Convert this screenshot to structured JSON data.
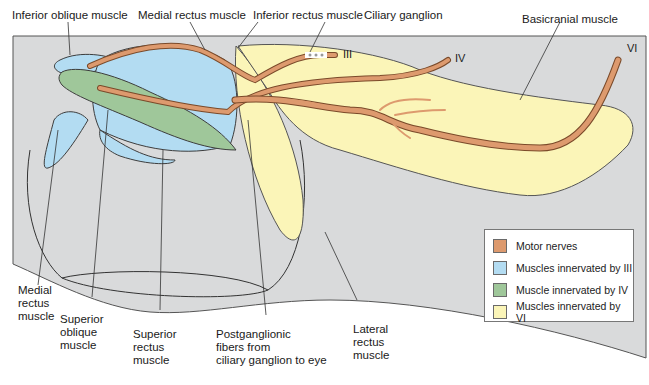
{
  "figure": {
    "type": "anatomical-diagram"
  },
  "labels": {
    "inferior_oblique_top": "Inferior oblique muscle",
    "medial_rectus_top": "Medial rectus muscle",
    "inferior_rectus_top": "Inferior rectus muscle",
    "ciliary_ganglion": "Ciliary ganglion",
    "basicranial_muscle": "Basicranial muscle",
    "medial_rectus_bottom": "Medial\nrectus\nmuscle",
    "superior_oblique": "Superior\noblique\nmuscle",
    "superior_rectus": "Superior\nrectus\nmuscle",
    "postganglionic": "Postganglionic\nfibers from\nciliary ganglion to eye",
    "lateral_rectus": "Lateral\nrectus\nmuscle"
  },
  "nerves": {
    "III": "III",
    "IV": "IV",
    "VI": "VI"
  },
  "legend": {
    "items": [
      {
        "label": "Motor nerves",
        "color": "#dd9a6e"
      },
      {
        "label": "Muscles innervated by III",
        "color": "#b3dcf2"
      },
      {
        "label": "Muscle innervated by IV",
        "color": "#9fc79a"
      },
      {
        "label": "Muscles innervated by VI",
        "color": "#fbf5b8"
      }
    ]
  },
  "colors": {
    "background_panel": "#d9dadb",
    "nerve": "#dd9a6e",
    "nerve_outline": "#7a4a2a",
    "muscle_III": "#b3dcf2",
    "muscle_IV": "#9fc79a",
    "muscle_VI": "#fbf5b8",
    "outline": "#3d3d3d"
  }
}
